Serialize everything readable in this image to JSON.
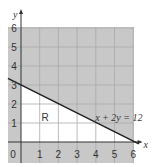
{
  "chart_data": {
    "type": "line",
    "title": "",
    "xlabel": "x",
    "ylabel": "y",
    "xlim": [
      -0.7,
      6.1
    ],
    "ylim": [
      -1.2,
      6.1
    ],
    "x_ticks": [
      "0",
      "1",
      "2",
      "3",
      "4",
      "5",
      "6"
    ],
    "y_ticks": [
      "1",
      "2",
      "3",
      "4",
      "5",
      "6"
    ],
    "grid": true,
    "series": [
      {
        "name": "x + 2y = 12",
        "x": [
          -0.7,
          6.3
        ],
        "y": [
          3.35,
          -0.1
        ]
      }
    ],
    "regions": [
      {
        "name": "R",
        "label": "R",
        "label_at": [
          1.1,
          1.3
        ],
        "description": "unshaded feasible region bounded by axes and line"
      }
    ],
    "annotations": [
      {
        "text": "x + 2y = 12",
        "at": [
          4.5,
          1.3
        ]
      }
    ],
    "colors": {
      "shade": "#c8c8c8",
      "grid": "#a9a9a9",
      "region": "#ffffff",
      "line": "#222222",
      "axis": "#333333"
    }
  }
}
